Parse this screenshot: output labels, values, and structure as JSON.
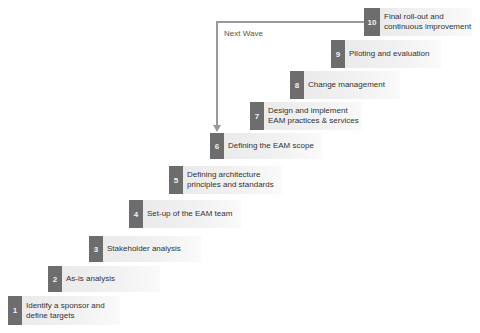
{
  "diagram": {
    "loop_label": "Next Wave",
    "colors": {
      "number_box": "#6d6d6d",
      "label_bg": "#eeeeee",
      "arrow": "#999999"
    },
    "steps": [
      {
        "number": "1",
        "label": "Identify a sponsor and\ndefine targets"
      },
      {
        "number": "2",
        "label": "As-is analysis"
      },
      {
        "number": "3",
        "label": "Stakeholder analysis"
      },
      {
        "number": "4",
        "label": "Set-up of the EAM team"
      },
      {
        "number": "5",
        "label": "Defining architecture\nprinciples and standards"
      },
      {
        "number": "6",
        "label": "Defining the EAM scope"
      },
      {
        "number": "7",
        "label": "Design and implement\nEAM practices & services"
      },
      {
        "number": "8",
        "label": "Change management"
      },
      {
        "number": "9",
        "label": "Piloting and evaluation"
      },
      {
        "number": "10",
        "label": "Final roll-out and\ncontinuous improvement"
      }
    ]
  }
}
